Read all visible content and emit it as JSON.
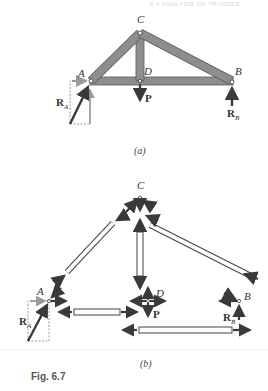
{
  "running_head": "6.4 ANALYSIS OF TRUSSES",
  "figure": {
    "label": "Fig. 6.7",
    "part_a": {
      "caption": "(a)",
      "joints": {
        "A": "A",
        "B": "B",
        "C": "C",
        "D": "D"
      },
      "forces": {
        "P": "P",
        "RA_main": "R",
        "RA_sub": "A",
        "RB_main": "R",
        "RB_sub": "B"
      }
    },
    "part_b": {
      "caption": "(b)",
      "joints": {
        "A": "A",
        "B": "B",
        "C": "C",
        "D": "D"
      },
      "forces": {
        "P": "P",
        "RA_main": "R",
        "RA_sub": "A",
        "RB_main": "R",
        "RB_sub": "B"
      }
    }
  },
  "colors": {
    "member_fill": "#8e8e8e",
    "member_edge": "#5a5a5a",
    "arrow": "#3a3a3a",
    "component_dashed": "#9a9a9a",
    "free_body_member": "#ffffff"
  }
}
